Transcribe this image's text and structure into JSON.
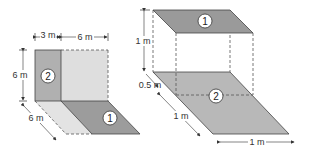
{
  "colors": {
    "dark_fill": "#9a9a9a",
    "medium_fill": "#b5b5b5",
    "light_fill": "#dcdcdc",
    "lighter_fill": "#e6e6e6",
    "stroke": "#333333",
    "dash": "#444444"
  },
  "left_figure": {
    "width_top_left": "3 m",
    "width_top_right": "6 m",
    "height_label": "6 m",
    "depth_label": "6 m",
    "region_1_label": "1",
    "region_2_label": "2"
  },
  "right_figure": {
    "height_label": "1 m",
    "offset_label": "0.5 m",
    "depth_label": "1 m",
    "width_label": "1 m",
    "region_1_label": "1",
    "region_2_label": "2"
  }
}
